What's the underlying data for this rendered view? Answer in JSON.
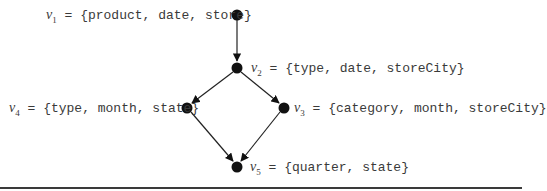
{
  "diagram": {
    "type": "lattice",
    "nodes": [
      {
        "id": "v1",
        "name": "v",
        "sub": "1",
        "set": "= {product, date, store}"
      },
      {
        "id": "v2",
        "name": "v",
        "sub": "2",
        "set": "= {type, date, storeCity}"
      },
      {
        "id": "v3",
        "name": "v",
        "sub": "3",
        "set": "= {category, month, storeCity}"
      },
      {
        "id": "v4",
        "name": "v",
        "sub": "4",
        "set": "= {type, month, state}"
      },
      {
        "id": "v5",
        "name": "v",
        "sub": "5",
        "set": "= {quarter, state}"
      }
    ],
    "edges": [
      {
        "from": "v1",
        "to": "v2"
      },
      {
        "from": "v2",
        "to": "v4"
      },
      {
        "from": "v2",
        "to": "v3"
      },
      {
        "from": "v4",
        "to": "v5"
      },
      {
        "from": "v3",
        "to": "v5"
      }
    ],
    "colors": {
      "node": "#111111",
      "edge": "#222222",
      "text": "#3a3a3a"
    }
  }
}
